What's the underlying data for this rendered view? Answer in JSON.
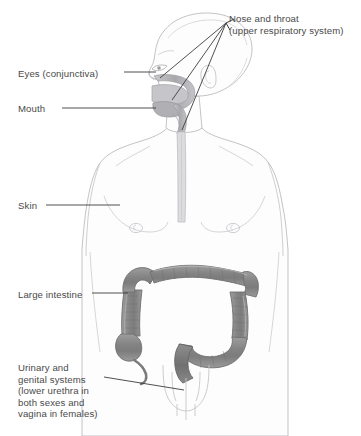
{
  "figure": {
    "background_color": "#ffffff",
    "outline_color": "#b9b9bd",
    "organ_color": "#8a8a8a",
    "organ_color_light": "#b5b5b5",
    "organ_color_dark": "#6e6e6e",
    "label_color": "#4a4a4a",
    "leader_color": "#3c3c3c"
  },
  "labels": {
    "nose_throat": {
      "line1": "Nose and throat",
      "line2": "(upper respiratory system)"
    },
    "eyes": {
      "line1": "Eyes (conjunctiva)"
    },
    "mouth": {
      "line1": "Mouth"
    },
    "skin": {
      "line1": "Skin"
    },
    "large_intestine": {
      "line1": "Large intestine"
    },
    "urinary_genital": {
      "line1": "Urinary and",
      "line2": "genital systems",
      "line3": "(lower urethra in",
      "line4": "both sexes and",
      "line5": "vagina in females)"
    }
  },
  "anatomy": {
    "parts": [
      "head-profile",
      "ear",
      "nasal-cavity",
      "oral-cavity",
      "tongue",
      "pharynx",
      "trachea",
      "esophagus",
      "neck",
      "shoulders",
      "torso",
      "left-nipple",
      "right-nipple",
      "navel",
      "ascending-colon",
      "transverse-colon",
      "descending-colon",
      "sigmoid-colon",
      "rectum",
      "cecum",
      "appendix",
      "pelvic-outline",
      "urethra"
    ]
  }
}
